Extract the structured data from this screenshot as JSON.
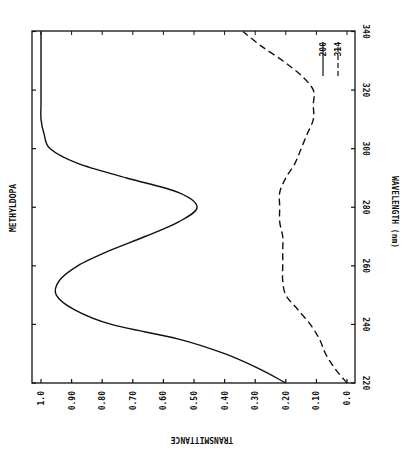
{
  "chart_data": {
    "type": "line",
    "title": "METHYLDOPA",
    "xlabel": "WAVELENGTH (nm)",
    "ylabel": "TRANSMITTANCE",
    "orientation": "rotated 90deg: wavelength runs bottom-to-top, transmittance runs right-to-left (1.0 at left, 0.0 at right)",
    "xlim": [
      220,
      340
    ],
    "ylim": [
      0.0,
      1.0
    ],
    "x_ticks": [
      "220",
      "240",
      "260",
      "280",
      "300",
      "320",
      "340"
    ],
    "y_ticks": [
      "1.0",
      "0.90",
      "0.80",
      "0.70",
      "0.60",
      "0.50",
      "0.40",
      "0.30",
      "0.20",
      "0.10",
      "0.0"
    ],
    "grid": false,
    "legend_position": "upper right (inside plot, rotated)",
    "x": [
      220,
      225,
      230,
      235,
      240,
      245,
      250,
      255,
      260,
      265,
      270,
      275,
      280,
      285,
      290,
      295,
      300,
      305,
      310,
      315,
      320,
      325,
      330,
      335,
      340
    ],
    "series": [
      {
        "name": "200",
        "style": "solid",
        "values": [
          0.2,
          0.29,
          0.4,
          0.55,
          0.77,
          0.89,
          0.95,
          0.94,
          0.88,
          0.78,
          0.66,
          0.55,
          0.49,
          0.55,
          0.72,
          0.88,
          0.97,
          0.99,
          1.0,
          1.0,
          1.0,
          1.0,
          1.0,
          1.0,
          1.0
        ]
      },
      {
        "name": "314",
        "style": "dashed",
        "values": [
          0.0,
          0.04,
          0.07,
          0.09,
          0.12,
          0.16,
          0.2,
          0.21,
          0.21,
          0.21,
          0.21,
          0.22,
          0.22,
          0.22,
          0.2,
          0.17,
          0.15,
          0.13,
          0.11,
          0.11,
          0.11,
          0.15,
          0.21,
          0.28,
          0.34
        ]
      }
    ]
  },
  "labels": {
    "title": "METHYLDOPA",
    "xlabel": "WAVELENGTH (nm)",
    "ylabel": "TRANSMITTANCE",
    "legend_solid": "200",
    "legend_dashed": "314"
  }
}
